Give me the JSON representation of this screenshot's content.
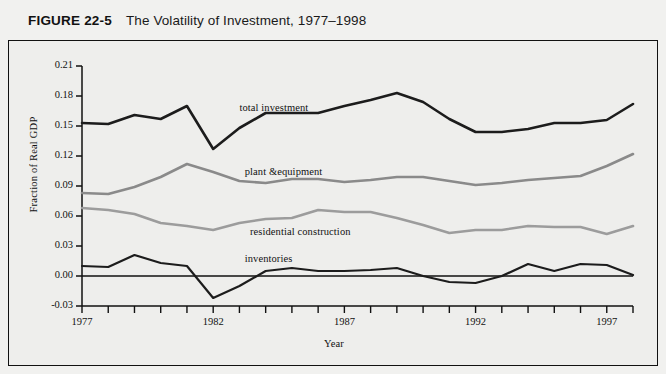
{
  "header": {
    "figure_number": "FIGURE 22-5",
    "title": "The Volatility of Investment, 1977–1998"
  },
  "chart_data": {
    "type": "line",
    "title": "The Volatility of Investment, 1977–1998",
    "xlabel": "Year",
    "ylabel": "Fraction of Real GDP",
    "xlim": [
      1977,
      1998
    ],
    "ylim": [
      -0.03,
      0.21
    ],
    "yticks": [
      "0.21",
      "0.18",
      "0.15",
      "0.12",
      "0.09",
      "0.06",
      "0.03",
      "0.00",
      "-0.03"
    ],
    "ytick_values": [
      0.21,
      0.18,
      0.15,
      0.12,
      0.09,
      0.06,
      0.03,
      0.0,
      -0.03
    ],
    "xticks_labeled": [
      "1977",
      "1982",
      "1987",
      "1992",
      "1997"
    ],
    "xtick_values": [
      1977,
      1978,
      1979,
      1980,
      1981,
      1982,
      1983,
      1984,
      1985,
      1986,
      1987,
      1988,
      1989,
      1990,
      1991,
      1992,
      1993,
      1994,
      1995,
      1996,
      1997,
      1998
    ],
    "grid": false,
    "legend": "inline-labels",
    "zero_line": true,
    "x": [
      1977,
      1978,
      1979,
      1980,
      1981,
      1982,
      1983,
      1984,
      1985,
      1986,
      1987,
      1988,
      1989,
      1990,
      1991,
      1992,
      1993,
      1994,
      1995,
      1996,
      1997,
      1998
    ],
    "series": [
      {
        "name": "total investment",
        "color": "#1c1c1c",
        "width": 2.6,
        "label_x": 1983.0,
        "label_y": 0.166,
        "values": [
          0.153,
          0.152,
          0.161,
          0.157,
          0.17,
          0.127,
          0.148,
          0.163,
          0.163,
          0.163,
          0.17,
          0.176,
          0.183,
          0.174,
          0.157,
          0.144,
          0.144,
          0.147,
          0.153,
          0.153,
          0.156,
          0.172
        ]
      },
      {
        "name": "plant &equipment",
        "color": "#8a8a8a",
        "width": 2.6,
        "label_x": 1983.2,
        "label_y": 0.102,
        "values": [
          0.083,
          0.082,
          0.089,
          0.099,
          0.112,
          0.104,
          0.095,
          0.093,
          0.097,
          0.097,
          0.094,
          0.096,
          0.099,
          0.099,
          0.095,
          0.091,
          0.093,
          0.096,
          0.098,
          0.1,
          0.11,
          0.122
        ]
      },
      {
        "name": "residential construction",
        "color": "#9c9c9c",
        "width": 2.6,
        "label_x": 1983.4,
        "label_y": 0.042,
        "values": [
          0.068,
          0.066,
          0.062,
          0.053,
          0.05,
          0.046,
          0.053,
          0.057,
          0.058,
          0.066,
          0.064,
          0.064,
          0.058,
          0.051,
          0.043,
          0.046,
          0.046,
          0.05,
          0.049,
          0.049,
          0.042,
          0.05
        ]
      },
      {
        "name": "inventories",
        "color": "#1c1c1c",
        "width": 2.2,
        "label_x": 1983.2,
        "label_y": 0.015,
        "values": [
          0.01,
          0.009,
          0.021,
          0.013,
          0.01,
          -0.022,
          -0.01,
          0.005,
          0.008,
          0.005,
          0.005,
          0.006,
          0.008,
          0.0,
          -0.006,
          -0.007,
          0.0,
          0.012,
          0.005,
          0.012,
          0.011,
          0.001
        ]
      }
    ]
  }
}
